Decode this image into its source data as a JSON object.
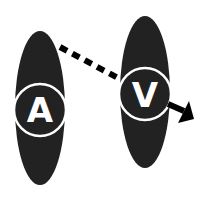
{
  "diagram": {
    "nodes": [
      {
        "id": "a",
        "label": "A"
      },
      {
        "id": "v",
        "label": "V"
      }
    ],
    "edges": [
      {
        "from": "a",
        "to": "v",
        "style": "dashed"
      },
      {
        "from": "v",
        "to": "out",
        "style": "solid-arrow"
      }
    ],
    "colors": {
      "fill": "#222222",
      "ring": "#ffffff",
      "arrow": "#000000",
      "background": "#ffffff"
    }
  }
}
